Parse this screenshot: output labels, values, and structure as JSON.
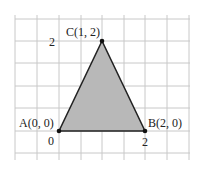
{
  "diagram": {
    "type": "coordinate-grid-triangle",
    "vertices": [
      {
        "name": "A",
        "label": "A(0, 0)",
        "x": 0,
        "y": 0
      },
      {
        "name": "B",
        "label": "B(2, 0)",
        "x": 2,
        "y": 0
      },
      {
        "name": "C",
        "label": "C(1, 2)",
        "x": 1,
        "y": 2
      }
    ],
    "axis_ticks": {
      "origin": "0",
      "x_tick": "2",
      "y_tick": "2"
    },
    "colors": {
      "fill": "#b8b8b8",
      "grid": "#c8c8c8",
      "edge": "#222222"
    }
  }
}
